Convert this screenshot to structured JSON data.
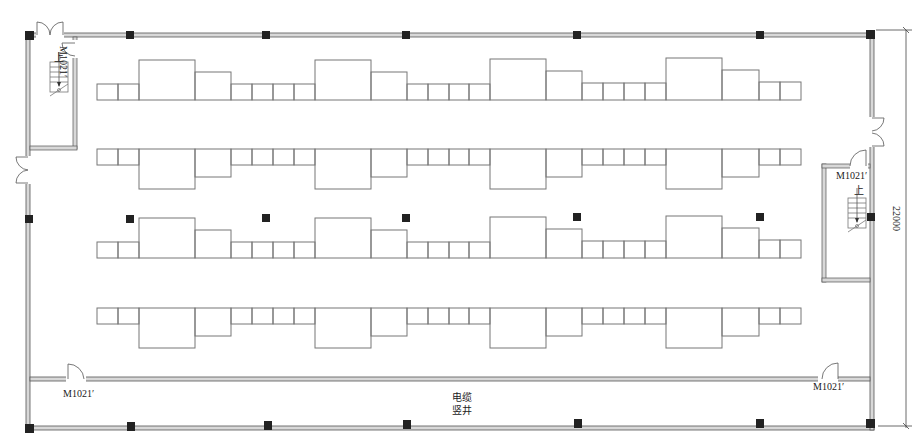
{
  "drawing": {
    "type": "architectural-floor-plan",
    "colors": {
      "wall_outer": "#555555",
      "wall_fill": "#d8d8d8",
      "line": "#777777",
      "column": "#222222",
      "background": "#ffffff"
    }
  },
  "labels": {
    "door_top_left": "M1021′",
    "door_right_stair": "M1021′",
    "door_bottom_left": "M1021′",
    "door_bottom_right": "M1021′",
    "stair_up_left": "上",
    "stair_up_right": "上",
    "cable_shaft_line1": "电缆",
    "cable_shaft_line2": "竖井",
    "dimension_height": "22000"
  },
  "columns": {
    "top_x": [
      130,
      266,
      406,
      577,
      760
    ],
    "middle_x": [
      130,
      266,
      406,
      577,
      760
    ],
    "bottom_x": [
      131,
      268,
      407,
      578,
      760
    ]
  },
  "equipment_rows": [
    {
      "id": "row-1",
      "baseline_y": 100,
      "orientation": "up"
    },
    {
      "id": "row-2",
      "baseline_y": 149,
      "orientation": "down"
    },
    {
      "id": "row-3",
      "baseline_y": 258,
      "orientation": "up"
    },
    {
      "id": "row-4",
      "baseline_y": 308,
      "orientation": "down"
    }
  ]
}
